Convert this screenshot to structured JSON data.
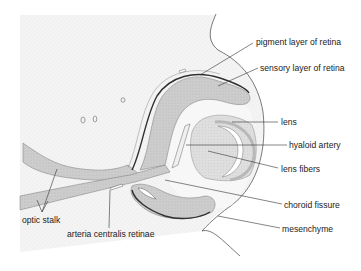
{
  "diagram": {
    "colors": {
      "background": "#ffffff",
      "mesoderm_stipple": "#f1f1f1",
      "neural_tissue": "#cfcfcf",
      "pigment_layer": "#3a3a3a",
      "lens": "#d6d6d6",
      "lens_fibers": "#e2e2e2",
      "leader_line": "#333333",
      "label_text": "#222222"
    },
    "labels": [
      {
        "id": "pigment-layer",
        "text": "pigment layer of retina"
      },
      {
        "id": "sensory-layer",
        "text": "sensory layer of retina"
      },
      {
        "id": "lens",
        "text": "lens"
      },
      {
        "id": "hyaloid-artery",
        "text": "hyaloid artery"
      },
      {
        "id": "lens-fibers",
        "text": "lens fibers"
      },
      {
        "id": "choroid-fissure",
        "text": "choroid fissure"
      },
      {
        "id": "mesenchyme",
        "text": "mesenchyme"
      },
      {
        "id": "optic-stalk",
        "text": "optic stalk"
      },
      {
        "id": "arteria-centralis",
        "text": "arteria centralis retinae"
      }
    ]
  }
}
